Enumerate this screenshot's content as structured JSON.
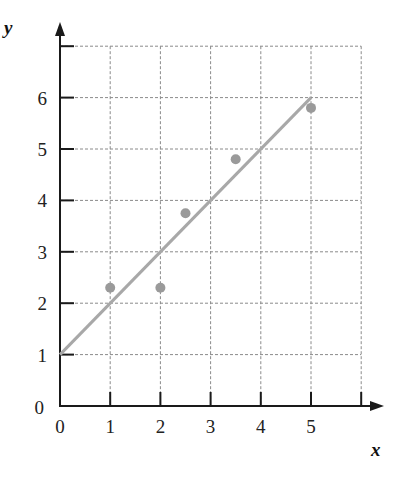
{
  "chart_data": {
    "type": "scatter",
    "title": "",
    "xlabel": "x",
    "ylabel": "y",
    "xlim": [
      0,
      6
    ],
    "ylim": [
      0,
      7
    ],
    "grid": true,
    "x_ticks": [
      0,
      1,
      2,
      3,
      4,
      5
    ],
    "y_ticks": [
      0,
      1,
      2,
      3,
      4,
      5,
      6
    ],
    "series": [
      {
        "name": "data points",
        "type": "scatter",
        "points": [
          {
            "x": 1,
            "y": 2.3
          },
          {
            "x": 2,
            "y": 2.3
          },
          {
            "x": 2.5,
            "y": 3.75
          },
          {
            "x": 3.5,
            "y": 4.8
          },
          {
            "x": 5,
            "y": 5.8
          }
        ]
      },
      {
        "name": "fitted line",
        "type": "line",
        "points": [
          {
            "x": 0,
            "y": 1
          },
          {
            "x": 5,
            "y": 6
          }
        ],
        "equation": "y = x + 1"
      }
    ],
    "legend": null
  },
  "colors": {
    "axis": "#1a1a1a",
    "grid": "#8a8a8a",
    "line": "#a8a8a8",
    "points": "#9a9a9a"
  }
}
